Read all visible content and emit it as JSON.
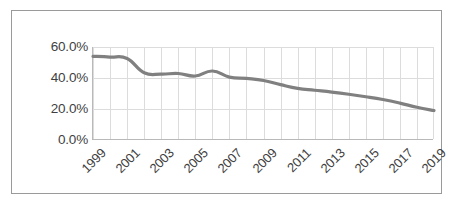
{
  "chart_data": {
    "type": "line",
    "title": "",
    "subtitle": "",
    "xlabel": "",
    "ylabel": "",
    "x": [
      1999,
      2000,
      2001,
      2002,
      2003,
      2004,
      2005,
      2006,
      2007,
      2008,
      2009,
      2010,
      2011,
      2012,
      2013,
      2014,
      2015,
      2016,
      2017,
      2018,
      2019
    ],
    "series": [
      {
        "name": "Rate",
        "values": [
          54.0,
          53.5,
          52.6,
          43.4,
          42.5,
          42.9,
          41.3,
          44.5,
          40.6,
          39.7,
          38.4,
          35.7,
          33.3,
          32.1,
          30.9,
          29.5,
          27.9,
          26.1,
          23.8,
          21.1,
          19.0
        ],
        "color": "#808080"
      }
    ],
    "ylim": [
      0.0,
      60.0
    ],
    "ytick_values": [
      0.0,
      20.0,
      40.0,
      60.0
    ],
    "ytick_labels": [
      "0.0%",
      "20.0%",
      "40.0%",
      "60.0%"
    ],
    "xtick_values": [
      1999,
      2001,
      2003,
      2005,
      2007,
      2009,
      2011,
      2013,
      2015,
      2017,
      2019
    ],
    "xtick_labels": [
      "1999",
      "2001",
      "2003",
      "2005",
      "2007",
      "2009",
      "2011",
      "2013",
      "2015",
      "2017",
      "2019"
    ],
    "xtick_rotation_deg": 45,
    "grid": {
      "horizontal": true,
      "vertical": true,
      "color": "#dcdcdc"
    },
    "legend": {
      "visible": false,
      "position": "none"
    },
    "axis_line_color": "#b9b9b9",
    "plot_background": "#ffffff",
    "frame_border_color": "#9a9a9a",
    "tick_label_color": "#3f3f3f"
  }
}
